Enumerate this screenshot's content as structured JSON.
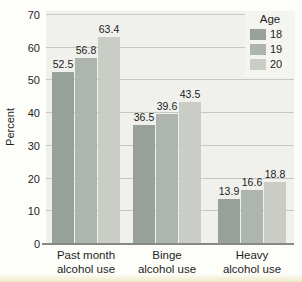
{
  "chart_data": {
    "type": "bar",
    "categories": [
      "Past month\nalcohol use",
      "Binge\nalcohol use",
      "Heavy\nalcohol use"
    ],
    "series": [
      {
        "name": "18",
        "color": "#98a09a",
        "values": [
          52.5,
          36.5,
          13.9
        ]
      },
      {
        "name": "19",
        "color": "#aeb4ae",
        "values": [
          56.8,
          39.6,
          16.6
        ]
      },
      {
        "name": "20",
        "color": "#c9cdc6",
        "values": [
          63.4,
          43.5,
          18.8
        ]
      }
    ],
    "ylabel": "Percent",
    "ylim": [
      0,
      70
    ],
    "ytick_step": 10,
    "grid": true,
    "legend": {
      "title": "Age",
      "position": "top-right"
    },
    "colors": {
      "plot_bg": "#f0f1ed",
      "legend_bg": "#f4f5f1",
      "gridline": "#c6c9c2",
      "axis": "#878a83",
      "text": "#1e1e1e",
      "page_bg": "#fdfdfa"
    }
  }
}
